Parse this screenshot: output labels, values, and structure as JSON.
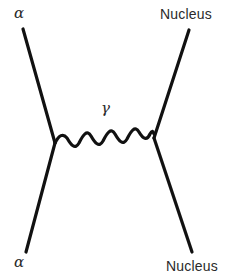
{
  "diagram": {
    "type": "Feynman diagram",
    "labels": {
      "incoming_alpha": "α",
      "outgoing_alpha": "α",
      "incoming_nucleus": "Nucleus",
      "outgoing_nucleus": "Nucleus",
      "photon": "γ"
    },
    "colors": {
      "line": "#111111",
      "text": "#2a2a2a",
      "background": "#ffffff"
    }
  }
}
